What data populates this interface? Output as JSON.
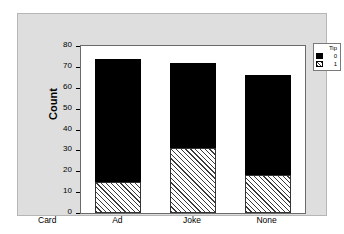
{
  "chart_data": {
    "type": "bar",
    "title": "",
    "subtitle": "",
    "stacked": true,
    "categories": [
      "Ad",
      "Joke",
      "None"
    ],
    "series": [
      {
        "name": "1",
        "label": "1",
        "pattern": "hatch",
        "color": "#ffffff",
        "values": [
          15,
          31,
          18
        ]
      },
      {
        "name": "0",
        "label": "0",
        "pattern": "solid",
        "color": "#000000",
        "values": [
          59,
          41,
          48
        ]
      }
    ],
    "totals": [
      74,
      72,
      66
    ],
    "xlabel": "Card",
    "ylabel": "Count",
    "ylim": [
      0,
      80
    ],
    "yticks": [
      0,
      10,
      20,
      30,
      40,
      50,
      60,
      70,
      80
    ],
    "ytick_labels": [
      "0",
      "10",
      "20",
      "30",
      "40",
      "50",
      "60",
      "70",
      "80"
    ],
    "grid": false,
    "legend": {
      "title": "Tip",
      "position": "top-right",
      "entries": [
        {
          "label": "0",
          "pattern": "solid"
        },
        {
          "label": "1",
          "pattern": "hatch"
        }
      ]
    }
  },
  "axes": {
    "y_title": "Count",
    "x_title": "Card"
  },
  "colors": {
    "panel_background": "#dedede",
    "plot_background": "#ffffff",
    "frame_border": "#6b6b6b",
    "series_solid": "#000000",
    "series_hatch_line": "#3a3a3a",
    "text": "#000000"
  }
}
